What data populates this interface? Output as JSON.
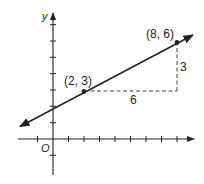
{
  "diagram": {
    "type": "coordinate-plane-slope",
    "axes": {
      "x_label": "",
      "y_label": "y",
      "origin_label": "O",
      "x_ticks": [
        -1,
        1,
        2,
        3,
        4,
        5,
        6,
        7,
        8,
        9
      ],
      "y_ticks": [
        -1,
        1,
        2,
        3,
        4,
        5,
        6,
        7
      ]
    },
    "points": [
      {
        "label": "(2, 3)",
        "x": 2,
        "y": 3
      },
      {
        "label": "(8, 6)",
        "x": 8,
        "y": 6
      }
    ],
    "line": {
      "slope": 0.5,
      "y_intercept": 2,
      "arrows": "both"
    },
    "run_label": "6",
    "rise_label": "3",
    "colors": {
      "ink": "#222222",
      "background": "#ffffff"
    }
  }
}
